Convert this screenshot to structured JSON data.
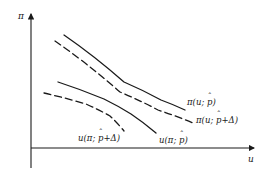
{
  "figure": {
    "type": "line-diagram",
    "background": "#ffffff",
    "ink": "#1a1a1a"
  },
  "axes": {
    "y_label": "π",
    "x_label": "u",
    "origin": [
      31,
      148
    ],
    "y_top": [
      31,
      14
    ],
    "y_bottom": [
      31,
      168
    ],
    "x_right": [
      254,
      148
    ],
    "arrows": true,
    "ticks": false,
    "grid": false
  },
  "chart_data": {
    "type": "line",
    "title": "",
    "xlabel": "u",
    "ylabel": "π",
    "xlim": [
      31,
      254
    ],
    "ylim": [
      148,
      14
    ],
    "grid": false,
    "legend": "inline-annotations",
    "series": [
      {
        "name": "pi(u; p-hat)",
        "style": "solid",
        "role": "iso-profit-baseline",
        "points": [
          [
            64,
            35
          ],
          [
            124,
            82
          ],
          [
            161,
            100
          ],
          [
            185,
            110
          ]
        ]
      },
      {
        "name": "pi(u; p-hat + Delta)",
        "style": "dashed",
        "role": "iso-profit-shifted",
        "points": [
          [
            55,
            41
          ],
          [
            120,
            92
          ],
          [
            158,
            110
          ],
          [
            193,
            123
          ]
        ]
      },
      {
        "name": "u(pi; p-hat)",
        "style": "solid",
        "role": "indifference-baseline",
        "points": [
          [
            58,
            82
          ],
          [
            104,
            99
          ],
          [
            131,
            114
          ],
          [
            156,
            133
          ]
        ]
      },
      {
        "name": "u(pi; p-hat + Delta)",
        "style": "dashed",
        "role": "indifference-shifted",
        "points": [
          [
            44,
            93
          ],
          [
            86,
            104
          ],
          [
            110,
            116
          ],
          [
            124,
            131
          ]
        ]
      }
    ]
  },
  "annotations": [
    {
      "id": "label-pi-baseline",
      "pre": "π(u; ",
      "base": "p",
      "hat": "ˆ",
      "post": ")",
      "x": 187,
      "y": 98
    },
    {
      "id": "label-pi-shifted",
      "pre": "π(u; ",
      "base": "p",
      "hat": "ˆ",
      "post": "+Δ)",
      "x": 196,
      "y": 116
    },
    {
      "id": "label-u-shifted",
      "pre": "u(π; ",
      "base": "p",
      "hat": "ˆ",
      "post": "+Δ)",
      "x": 78,
      "y": 134
    },
    {
      "id": "label-u-baseline",
      "pre": "u(π; ",
      "base": "p",
      "hat": "ˆ",
      "post": ")",
      "x": 159,
      "y": 136
    }
  ]
}
